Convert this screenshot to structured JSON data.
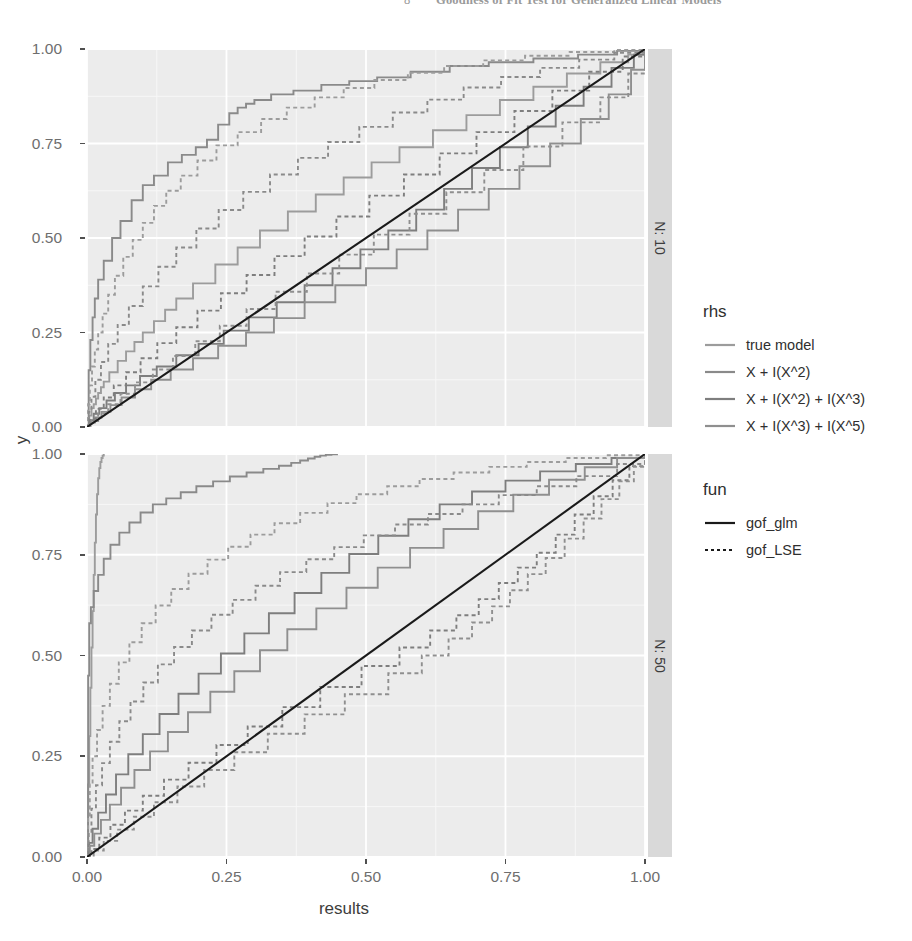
{
  "page_header": {
    "page_number": "8",
    "title": "Goodness of Fit Test for Generalized Linear Models"
  },
  "chart_data": {
    "type": "line",
    "subtype": "ecdf-step",
    "title": "",
    "xlabel": "results",
    "ylabel": "y",
    "xlim": [
      0,
      1
    ],
    "ylim": [
      0,
      1
    ],
    "xticks": [
      "0.00",
      "0.25",
      "0.50",
      "0.75",
      "1.00"
    ],
    "yticks": [
      "0.00",
      "0.25",
      "0.50",
      "0.75",
      "1.00"
    ],
    "xtick_values": [
      0,
      0.25,
      0.5,
      0.75,
      1
    ],
    "ytick_values": [
      0,
      0.25,
      0.5,
      0.75,
      1
    ],
    "grid": "major-minor-white-on-grey",
    "legend_position": "right",
    "facet_var": "N",
    "facets": [
      {
        "strip_label": "N: 10",
        "value": 10
      },
      {
        "strip_label": "N: 50",
        "value": 50
      }
    ],
    "reference_line": {
      "name": "identity",
      "from": [
        0,
        0
      ],
      "to": [
        1,
        1
      ],
      "color": "#1a1a1a",
      "style": "solid"
    },
    "legends": [
      {
        "title": "rhs",
        "entries": [
          {
            "label": "true model",
            "color": "#9c9c9c"
          },
          {
            "label": "X + I(X^2)",
            "color": "#8a8a8a"
          },
          {
            "label": "X + I(X^2) + I(X^3)",
            "color": "#7e7e7e"
          },
          {
            "label": "X + I(X^3) + I(X^5)",
            "color": "#8f8f8f"
          }
        ]
      },
      {
        "title": "fun",
        "entries": [
          {
            "label": "gof_glm",
            "style": "solid",
            "color": "#1a1a1a"
          },
          {
            "label": "gof_LSE",
            "style": "dotted",
            "color": "#1a1a1a"
          }
        ]
      }
    ],
    "series": [
      {
        "facet": "N: 10",
        "rhs": "true model",
        "fun": "gof_glm",
        "style": "solid",
        "color": "#9c9c9c",
        "x": [
          0.0,
          0.004,
          0.008,
          0.012,
          0.016,
          0.02,
          0.025,
          0.03,
          0.04,
          0.055,
          0.07,
          0.085,
          0.1,
          0.12,
          0.14,
          0.16,
          0.19,
          0.23,
          0.27,
          0.31,
          0.36,
          0.41,
          0.46,
          0.51,
          0.56,
          0.62,
          0.68,
          0.74,
          0.8,
          0.86,
          0.92,
          0.97,
          1.0
        ],
        "y": [
          0.0,
          0.03,
          0.05,
          0.06,
          0.075,
          0.09,
          0.105,
          0.12,
          0.145,
          0.175,
          0.2,
          0.225,
          0.25,
          0.28,
          0.31,
          0.34,
          0.38,
          0.43,
          0.475,
          0.52,
          0.57,
          0.615,
          0.66,
          0.7,
          0.74,
          0.785,
          0.825,
          0.865,
          0.9,
          0.935,
          0.965,
          0.985,
          1.0
        ]
      },
      {
        "facet": "N: 10",
        "rhs": "X + I(X^2)",
        "fun": "gof_glm",
        "style": "solid",
        "color": "#8a8a8a",
        "x": [
          0.0,
          0.003,
          0.006,
          0.01,
          0.014,
          0.02,
          0.03,
          0.045,
          0.06,
          0.08,
          0.1,
          0.12,
          0.145,
          0.17,
          0.195,
          0.215,
          0.235,
          0.255,
          0.27,
          0.285,
          0.3,
          0.33,
          0.37,
          0.42,
          0.47,
          0.52,
          0.58,
          0.65,
          0.72,
          0.8,
          0.88,
          0.95,
          1.0
        ],
        "y": [
          0.0,
          0.15,
          0.23,
          0.29,
          0.34,
          0.39,
          0.44,
          0.5,
          0.545,
          0.6,
          0.64,
          0.665,
          0.7,
          0.72,
          0.74,
          0.76,
          0.8,
          0.83,
          0.845,
          0.855,
          0.865,
          0.88,
          0.89,
          0.905,
          0.915,
          0.925,
          0.94,
          0.955,
          0.965,
          0.975,
          0.985,
          0.995,
          1.0
        ]
      },
      {
        "facet": "N: 10",
        "rhs": "X + I(X^2) + I(X^3)",
        "fun": "gof_glm",
        "style": "solid",
        "color": "#7e7e7e",
        "x": [
          0.0,
          0.005,
          0.012,
          0.022,
          0.035,
          0.05,
          0.07,
          0.095,
          0.125,
          0.16,
          0.2,
          0.245,
          0.29,
          0.34,
          0.39,
          0.44,
          0.49,
          0.54,
          0.59,
          0.64,
          0.69,
          0.74,
          0.79,
          0.84,
          0.89,
          0.94,
          0.98,
          1.0
        ],
        "y": [
          0.0,
          0.018,
          0.035,
          0.05,
          0.07,
          0.09,
          0.11,
          0.135,
          0.16,
          0.19,
          0.22,
          0.255,
          0.29,
          0.33,
          0.375,
          0.42,
          0.47,
          0.52,
          0.575,
          0.63,
          0.685,
          0.74,
          0.795,
          0.85,
          0.9,
          0.95,
          0.985,
          1.0
        ]
      },
      {
        "facet": "N: 10",
        "rhs": "X + I(X^3) + I(X^5)",
        "fun": "gof_glm",
        "style": "solid",
        "color": "#8f8f8f",
        "x": [
          0.0,
          0.006,
          0.014,
          0.026,
          0.042,
          0.062,
          0.086,
          0.115,
          0.15,
          0.19,
          0.235,
          0.285,
          0.335,
          0.39,
          0.445,
          0.5,
          0.555,
          0.61,
          0.665,
          0.72,
          0.775,
          0.83,
          0.885,
          0.935,
          0.975,
          1.0
        ],
        "y": [
          0.0,
          0.012,
          0.025,
          0.04,
          0.058,
          0.078,
          0.1,
          0.125,
          0.152,
          0.182,
          0.215,
          0.25,
          0.288,
          0.33,
          0.375,
          0.42,
          0.47,
          0.52,
          0.575,
          0.63,
          0.69,
          0.75,
          0.815,
          0.88,
          0.945,
          1.0
        ]
      },
      {
        "facet": "N: 10",
        "rhs": "true model",
        "fun": "gof_LSE",
        "style": "dotted",
        "color": "#9c9c9c",
        "x": [
          0.0,
          0.002,
          0.005,
          0.009,
          0.014,
          0.02,
          0.028,
          0.038,
          0.05,
          0.065,
          0.082,
          0.1,
          0.12,
          0.142,
          0.168,
          0.198,
          0.232,
          0.27,
          0.312,
          0.358,
          0.408,
          0.46,
          0.515,
          0.575,
          0.64,
          0.71,
          0.785,
          0.865,
          0.945,
          1.0
        ],
        "y": [
          0.0,
          0.06,
          0.11,
          0.16,
          0.205,
          0.25,
          0.3,
          0.35,
          0.4,
          0.45,
          0.495,
          0.54,
          0.585,
          0.625,
          0.665,
          0.705,
          0.745,
          0.78,
          0.815,
          0.845,
          0.872,
          0.897,
          0.918,
          0.937,
          0.955,
          0.97,
          0.982,
          0.992,
          0.998,
          1.0
        ]
      },
      {
        "facet": "N: 10",
        "rhs": "X + I(X^2)",
        "fun": "gof_LSE",
        "style": "dotted",
        "color": "#8a8a8a",
        "x": [
          0.0,
          0.003,
          0.008,
          0.015,
          0.025,
          0.038,
          0.055,
          0.075,
          0.1,
          0.128,
          0.16,
          0.196,
          0.236,
          0.28,
          0.328,
          0.378,
          0.432,
          0.488,
          0.548,
          0.61,
          0.675,
          0.742,
          0.812,
          0.882,
          0.945,
          1.0
        ],
        "y": [
          0.0,
          0.04,
          0.08,
          0.125,
          0.172,
          0.22,
          0.27,
          0.32,
          0.372,
          0.424,
          0.475,
          0.525,
          0.574,
          0.622,
          0.668,
          0.712,
          0.754,
          0.794,
          0.832,
          0.866,
          0.898,
          0.926,
          0.95,
          0.972,
          0.99,
          1.0
        ]
      },
      {
        "facet": "N: 10",
        "rhs": "X + I(X^2) + I(X^3)",
        "fun": "gof_LSE",
        "style": "dotted",
        "color": "#7e7e7e",
        "x": [
          0.0,
          0.006,
          0.016,
          0.03,
          0.048,
          0.07,
          0.096,
          0.126,
          0.16,
          0.198,
          0.24,
          0.286,
          0.336,
          0.39,
          0.447,
          0.506,
          0.568,
          0.632,
          0.698,
          0.766,
          0.834,
          0.9,
          0.96,
          1.0
        ],
        "y": [
          0.0,
          0.022,
          0.048,
          0.078,
          0.11,
          0.145,
          0.182,
          0.222,
          0.264,
          0.308,
          0.354,
          0.402,
          0.452,
          0.504,
          0.557,
          0.612,
          0.668,
          0.724,
          0.78,
          0.836,
          0.89,
          0.94,
          0.98,
          1.0
        ]
      },
      {
        "facet": "N: 10",
        "rhs": "X + I(X^3) + I(X^5)",
        "fun": "gof_LSE",
        "style": "dotted",
        "color": "#8f8f8f",
        "x": [
          0.0,
          0.008,
          0.02,
          0.038,
          0.06,
          0.086,
          0.118,
          0.154,
          0.194,
          0.238,
          0.286,
          0.338,
          0.394,
          0.452,
          0.514,
          0.578,
          0.644,
          0.712,
          0.782,
          0.852,
          0.92,
          0.97,
          1.0
        ],
        "y": [
          0.0,
          0.016,
          0.036,
          0.06,
          0.088,
          0.118,
          0.152,
          0.188,
          0.227,
          0.268,
          0.312,
          0.358,
          0.406,
          0.456,
          0.509,
          0.564,
          0.621,
          0.68,
          0.742,
          0.806,
          0.872,
          0.935,
          1.0
        ]
      },
      {
        "facet": "N: 50",
        "rhs": "true model",
        "fun": "gof_glm",
        "style": "solid",
        "color": "#9c9c9c",
        "x": [
          0.0,
          0.002,
          0.004,
          0.006,
          0.008,
          0.01,
          0.012,
          0.014,
          0.016,
          0.018,
          0.02,
          0.022,
          0.024,
          0.026,
          0.028,
          0.03
        ],
        "y": [
          0.0,
          0.18,
          0.3,
          0.42,
          0.52,
          0.61,
          0.7,
          0.78,
          0.85,
          0.9,
          0.94,
          0.965,
          0.98,
          0.99,
          0.996,
          1.0
        ]
      },
      {
        "facet": "N: 50",
        "rhs": "X + I(X^2)",
        "fun": "gof_glm",
        "style": "solid",
        "color": "#8a8a8a",
        "x": [
          0.0,
          0.002,
          0.004,
          0.007,
          0.012,
          0.02,
          0.03,
          0.042,
          0.058,
          0.076,
          0.096,
          0.118,
          0.142,
          0.168,
          0.196,
          0.226,
          0.256,
          0.286,
          0.316,
          0.344,
          0.366,
          0.382,
          0.396,
          0.408,
          0.418,
          0.428,
          0.438,
          0.448
        ],
        "y": [
          0.0,
          0.45,
          0.58,
          0.62,
          0.66,
          0.7,
          0.74,
          0.775,
          0.805,
          0.83,
          0.855,
          0.875,
          0.89,
          0.905,
          0.92,
          0.932,
          0.944,
          0.954,
          0.963,
          0.971,
          0.978,
          0.984,
          0.989,
          0.993,
          0.996,
          0.998,
          0.999,
          1.0
        ]
      },
      {
        "facet": "N: 50",
        "rhs": "X + I(X^2) + I(X^3)",
        "fun": "gof_glm",
        "style": "solid",
        "color": "#7e7e7e",
        "x": [
          0.0,
          0.004,
          0.01,
          0.02,
          0.034,
          0.052,
          0.074,
          0.1,
          0.13,
          0.164,
          0.2,
          0.24,
          0.282,
          0.326,
          0.372,
          0.42,
          0.47,
          0.522,
          0.576,
          0.632,
          0.69,
          0.75,
          0.812,
          0.876,
          0.94,
          1.0
        ],
        "y": [
          0.0,
          0.035,
          0.07,
          0.11,
          0.155,
          0.205,
          0.255,
          0.305,
          0.355,
          0.405,
          0.455,
          0.505,
          0.555,
          0.605,
          0.655,
          0.705,
          0.752,
          0.797,
          0.838,
          0.875,
          0.907,
          0.934,
          0.957,
          0.975,
          0.99,
          1.0
        ]
      },
      {
        "facet": "N: 50",
        "rhs": "X + I(X^3) + I(X^5)",
        "fun": "gof_glm",
        "style": "solid",
        "color": "#8f8f8f",
        "x": [
          0.0,
          0.005,
          0.013,
          0.025,
          0.041,
          0.061,
          0.085,
          0.113,
          0.145,
          0.181,
          0.221,
          0.264,
          0.31,
          0.359,
          0.411,
          0.465,
          0.521,
          0.579,
          0.639,
          0.701,
          0.764,
          0.828,
          0.892,
          0.95,
          1.0
        ],
        "y": [
          0.0,
          0.028,
          0.058,
          0.092,
          0.13,
          0.172,
          0.216,
          0.262,
          0.31,
          0.359,
          0.41,
          0.461,
          0.513,
          0.565,
          0.617,
          0.668,
          0.718,
          0.767,
          0.814,
          0.858,
          0.899,
          0.936,
          0.967,
          0.99,
          1.0
        ]
      },
      {
        "facet": "N: 50",
        "rhs": "true model",
        "fun": "gof_LSE",
        "style": "dotted",
        "color": "#9c9c9c",
        "x": [
          0.0,
          0.002,
          0.005,
          0.01,
          0.018,
          0.028,
          0.041,
          0.057,
          0.076,
          0.098,
          0.123,
          0.151,
          0.182,
          0.216,
          0.253,
          0.293,
          0.336,
          0.382,
          0.431,
          0.483,
          0.538,
          0.596,
          0.657,
          0.721,
          0.788,
          0.858,
          0.93,
          1.0
        ],
        "y": [
          0.0,
          0.1,
          0.18,
          0.25,
          0.315,
          0.375,
          0.43,
          0.483,
          0.533,
          0.58,
          0.624,
          0.665,
          0.703,
          0.738,
          0.77,
          0.8,
          0.828,
          0.854,
          0.878,
          0.9,
          0.92,
          0.938,
          0.954,
          0.968,
          0.98,
          0.99,
          0.997,
          1.0
        ]
      },
      {
        "facet": "N: 50",
        "rhs": "X + I(X^2)",
        "fun": "gof_LSE",
        "style": "dotted",
        "color": "#8a8a8a",
        "x": [
          0.0,
          0.003,
          0.008,
          0.016,
          0.027,
          0.041,
          0.058,
          0.078,
          0.101,
          0.127,
          0.156,
          0.188,
          0.223,
          0.261,
          0.302,
          0.346,
          0.393,
          0.443,
          0.496,
          0.552,
          0.611,
          0.673,
          0.738,
          0.806,
          0.877,
          0.95,
          1.0
        ],
        "y": [
          0.0,
          0.06,
          0.12,
          0.178,
          0.233,
          0.286,
          0.337,
          0.386,
          0.433,
          0.478,
          0.521,
          0.562,
          0.601,
          0.638,
          0.673,
          0.707,
          0.739,
          0.769,
          0.798,
          0.825,
          0.851,
          0.875,
          0.898,
          0.92,
          0.945,
          0.975,
          1.0
        ]
      },
      {
        "facet": "N: 50",
        "rhs": "X + I(X^2) + I(X^3)",
        "fun": "gof_LSE",
        "style": "dotted",
        "color": "#7e7e7e",
        "x": [
          0.0,
          0.008,
          0.022,
          0.042,
          0.068,
          0.1,
          0.138,
          0.182,
          0.232,
          0.288,
          0.35,
          0.418,
          0.492,
          0.56,
          0.615,
          0.662,
          0.702,
          0.738,
          0.772,
          0.806,
          0.84,
          0.874,
          0.908,
          0.942,
          0.972,
          1.0
        ],
        "y": [
          0.0,
          0.02,
          0.048,
          0.08,
          0.115,
          0.152,
          0.192,
          0.234,
          0.278,
          0.324,
          0.372,
          0.422,
          0.474,
          0.52,
          0.562,
          0.6,
          0.64,
          0.68,
          0.718,
          0.755,
          0.8,
          0.85,
          0.895,
          0.935,
          0.97,
          1.0
        ]
      },
      {
        "facet": "N: 50",
        "rhs": "X + I(X^3) + I(X^5)",
        "fun": "gof_LSE",
        "style": "dotted",
        "color": "#8f8f8f",
        "x": [
          0.0,
          0.012,
          0.03,
          0.054,
          0.084,
          0.12,
          0.162,
          0.21,
          0.264,
          0.324,
          0.39,
          0.462,
          0.54,
          0.6,
          0.648,
          0.69,
          0.726,
          0.758,
          0.79,
          0.822,
          0.856,
          0.89,
          0.922,
          0.954,
          0.98,
          1.0
        ],
        "y": [
          0.0,
          0.016,
          0.04,
          0.068,
          0.1,
          0.136,
          0.175,
          0.216,
          0.26,
          0.306,
          0.354,
          0.404,
          0.456,
          0.5,
          0.542,
          0.582,
          0.622,
          0.662,
          0.702,
          0.742,
          0.79,
          0.84,
          0.888,
          0.932,
          0.968,
          1.0
        ]
      }
    ]
  }
}
